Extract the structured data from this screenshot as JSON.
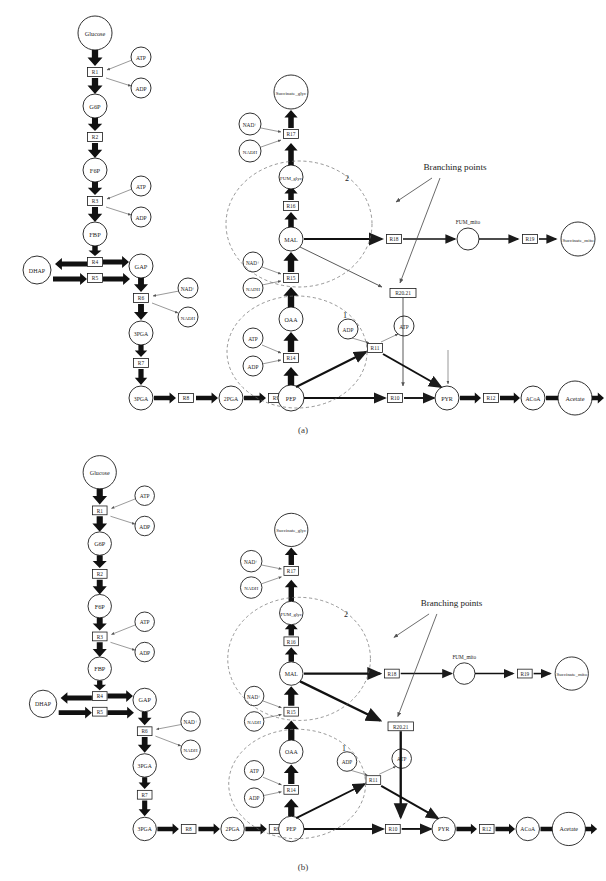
{
  "figure": {
    "panels": [
      {
        "id": "a",
        "caption": "(a)"
      },
      {
        "id": "b",
        "caption": "(b)"
      }
    ],
    "annotation_label": "Branching points",
    "ellipse_labels": {
      "one": "1",
      "two": "2"
    },
    "colors": {
      "node_stroke": "#1a1a1a",
      "arrow_fill": "#111111",
      "dashed_ellipse": "#6b6b6b",
      "thin_line": "#444444",
      "text": "#222222",
      "background": "#ffffff"
    }
  },
  "metabolites": {
    "glucose": "Glucose",
    "g6p": "G6P",
    "f6p": "F6P",
    "fbp": "FBP",
    "dhap": "DHAP",
    "gap": "GAP",
    "pga3": "3PGA",
    "pga2": "2PGA",
    "pep": "PEP",
    "pyr": "PYR",
    "acoa": "ACoA",
    "acetate": "Acetate",
    "oaa": "OAA",
    "mal": "MAL",
    "fum_glyc": "FUM_glyc",
    "succinate_glyc": "Succinate_glyc",
    "fum_mito": "FUM_mito",
    "succinate_mito": "Succinate_mito"
  },
  "cofactors": {
    "atp": "ATP",
    "adp": "ADP",
    "nad": "NAD⁺",
    "nadh": "NADH"
  },
  "reactions": {
    "r1": "R1",
    "r2": "R2",
    "r3": "R3",
    "r4": "R4",
    "r5": "R5",
    "r6": "R6",
    "r7": "R7",
    "r8": "R8",
    "r9": "R9",
    "r10": "R10",
    "r11": "R11",
    "r12": "R12",
    "r13": "R13",
    "r14": "R14",
    "r15": "R15",
    "r16": "R16",
    "r17": "R17",
    "r18": "R18",
    "r19": "R19",
    "r2021": "R20.21"
  },
  "chart_data": {
    "type": "diagram",
    "panels": [
      {
        "id": "a",
        "caption": "(a)",
        "nodes": [
          {
            "id": "Glucose",
            "label": "Glucose",
            "type": "metabolite"
          },
          {
            "id": "G6P",
            "label": "G6P",
            "type": "metabolite"
          },
          {
            "id": "F6P",
            "label": "F6P",
            "type": "metabolite"
          },
          {
            "id": "FBP",
            "label": "FBP",
            "type": "metabolite"
          },
          {
            "id": "DHAP",
            "label": "DHAP",
            "type": "metabolite"
          },
          {
            "id": "GAP",
            "label": "GAP",
            "type": "metabolite"
          },
          {
            "id": "3PGA",
            "label": "3PGA",
            "type": "metabolite"
          },
          {
            "id": "2PGA",
            "label": "2PGA",
            "type": "metabolite"
          },
          {
            "id": "PEP",
            "label": "PEP",
            "type": "metabolite"
          },
          {
            "id": "PYR",
            "label": "PYR",
            "type": "metabolite"
          },
          {
            "id": "ACoA",
            "label": "ACoA",
            "type": "metabolite"
          },
          {
            "id": "Acetate",
            "label": "Acetate",
            "type": "metabolite"
          },
          {
            "id": "OAA",
            "label": "OAA",
            "type": "metabolite"
          },
          {
            "id": "MAL",
            "label": "MAL",
            "type": "metabolite"
          },
          {
            "id": "FUM_glyc",
            "label": "FUM_glyc",
            "type": "metabolite"
          },
          {
            "id": "Succinate_glyc",
            "label": "Succinate_glyc",
            "type": "metabolite"
          },
          {
            "id": "FUM_mito",
            "label": "FUM_mito",
            "type": "metabolite"
          },
          {
            "id": "Succinate_mito",
            "label": "Succinate_mito",
            "type": "metabolite"
          },
          {
            "id": "ATP",
            "label": "ATP",
            "type": "cofactor"
          },
          {
            "id": "ADP",
            "label": "ADP",
            "type": "cofactor"
          },
          {
            "id": "NAD",
            "label": "NAD⁺",
            "type": "cofactor"
          },
          {
            "id": "NADH",
            "label": "NADH",
            "type": "cofactor"
          }
        ],
        "edges": [
          {
            "reaction": "R1",
            "from": "Glucose",
            "to": "G6P",
            "weight": "thick"
          },
          {
            "reaction": "R2",
            "from": "G6P",
            "to": "F6P",
            "weight": "thick"
          },
          {
            "reaction": "R3",
            "from": "F6P",
            "to": "FBP",
            "weight": "thick"
          },
          {
            "reaction": "R4",
            "from": "FBP",
            "to": "GAP",
            "weight": "thick"
          },
          {
            "reaction": "R5",
            "from": "DHAP",
            "to": "GAP",
            "weight": "thick"
          },
          {
            "reaction": "R6",
            "from": "GAP",
            "to": "3PGA",
            "weight": "thick"
          },
          {
            "reaction": "R7",
            "from": "3PGA",
            "to": "2PGA",
            "weight": "thick"
          },
          {
            "reaction": "R8",
            "from": "3PGA",
            "to": "2PGA",
            "weight": "thick"
          },
          {
            "reaction": "R9",
            "from": "2PGA",
            "to": "PEP",
            "weight": "thick"
          },
          {
            "reaction": "R10",
            "from": "PEP",
            "to": "PYR",
            "weight": "medium"
          },
          {
            "reaction": "R11",
            "from": "PEP",
            "to": "PYR",
            "weight": "medium"
          },
          {
            "reaction": "R12",
            "from": "PYR",
            "to": "ACoA",
            "weight": "medium"
          },
          {
            "reaction": "R13",
            "from": "ACoA",
            "to": "Acetate",
            "weight": "medium"
          },
          {
            "reaction": "R14",
            "from": "PEP",
            "to": "OAA",
            "weight": "thick"
          },
          {
            "reaction": "R15",
            "from": "OAA",
            "to": "MAL",
            "weight": "thick"
          },
          {
            "reaction": "R16",
            "from": "MAL",
            "to": "FUM_glyc",
            "weight": "thick"
          },
          {
            "reaction": "R17",
            "from": "FUM_glyc",
            "to": "Succinate_glyc",
            "weight": "thick"
          },
          {
            "reaction": "R18",
            "from": "MAL",
            "to": "FUM_mito",
            "weight": "medium"
          },
          {
            "reaction": "R19",
            "from": "FUM_mito",
            "to": "Succinate_mito",
            "weight": "medium"
          },
          {
            "reaction": "R20.21",
            "from": "MAL",
            "to": "PYR",
            "weight": "thin"
          }
        ],
        "ellipses": [
          {
            "label": "1",
            "encloses": [
              "PEP",
              "OAA",
              "R14",
              "R11",
              "ATP",
              "ADP"
            ]
          },
          {
            "label": "2",
            "encloses": [
              "MAL",
              "FUM_glyc",
              "R15",
              "R16",
              "NAD⁺",
              "NADH"
            ]
          }
        ],
        "annotations": [
          {
            "text": "Branching points",
            "points_to": [
              "R18",
              "R20.21"
            ]
          }
        ]
      },
      {
        "id": "b",
        "caption": "(b)",
        "nodes": [
          {
            "id": "Glucose",
            "label": "Glucose",
            "type": "metabolite"
          },
          {
            "id": "G6P",
            "label": "G6P",
            "type": "metabolite"
          },
          {
            "id": "F6P",
            "label": "F6P",
            "type": "metabolite"
          },
          {
            "id": "FBP",
            "label": "FBP",
            "type": "metabolite"
          },
          {
            "id": "DHAP",
            "label": "DHAP",
            "type": "metabolite"
          },
          {
            "id": "GAP",
            "label": "GAP",
            "type": "metabolite"
          },
          {
            "id": "3PGA",
            "label": "3PGA",
            "type": "metabolite"
          },
          {
            "id": "2PGA",
            "label": "2PGA",
            "type": "metabolite"
          },
          {
            "id": "PEP",
            "label": "PEP",
            "type": "metabolite"
          },
          {
            "id": "PYR",
            "label": "PYR",
            "type": "metabolite"
          },
          {
            "id": "ACoA",
            "label": "ACoA",
            "type": "metabolite"
          },
          {
            "id": "Acetate",
            "label": "Acetate",
            "type": "metabolite"
          },
          {
            "id": "OAA",
            "label": "OAA",
            "type": "metabolite"
          },
          {
            "id": "MAL",
            "label": "MAL",
            "type": "metabolite"
          },
          {
            "id": "FUM_glyc",
            "label": "FUM_glyc",
            "type": "metabolite"
          },
          {
            "id": "Succinate_glyc",
            "label": "Succinate_glyc",
            "type": "metabolite"
          },
          {
            "id": "FUM_mito",
            "label": "FUM_mito",
            "type": "metabolite"
          },
          {
            "id": "Succinate_mito",
            "label": "Succinate_mito",
            "type": "metabolite"
          },
          {
            "id": "ATP",
            "label": "ATP",
            "type": "cofactor"
          },
          {
            "id": "ADP",
            "label": "ADP",
            "type": "cofactor"
          },
          {
            "id": "NAD",
            "label": "NAD⁺",
            "type": "cofactor"
          },
          {
            "id": "NADH",
            "label": "NADH",
            "type": "cofactor"
          }
        ],
        "edges": [
          {
            "reaction": "R1",
            "from": "Glucose",
            "to": "G6P",
            "weight": "thick"
          },
          {
            "reaction": "R2",
            "from": "G6P",
            "to": "F6P",
            "weight": "thick"
          },
          {
            "reaction": "R3",
            "from": "F6P",
            "to": "FBP",
            "weight": "thick"
          },
          {
            "reaction": "R4",
            "from": "FBP",
            "to": "GAP",
            "weight": "thick"
          },
          {
            "reaction": "R5",
            "from": "DHAP",
            "to": "GAP",
            "weight": "thick"
          },
          {
            "reaction": "R6",
            "from": "GAP",
            "to": "3PGA",
            "weight": "thick"
          },
          {
            "reaction": "R7",
            "from": "3PGA",
            "to": "2PGA",
            "weight": "thick"
          },
          {
            "reaction": "R8",
            "from": "3PGA",
            "to": "2PGA",
            "weight": "thick"
          },
          {
            "reaction": "R9",
            "from": "2PGA",
            "to": "PEP",
            "weight": "thick"
          },
          {
            "reaction": "R10",
            "from": "PEP",
            "to": "PYR",
            "weight": "medium"
          },
          {
            "reaction": "R11",
            "from": "PEP",
            "to": "PYR",
            "weight": "medium"
          },
          {
            "reaction": "R12",
            "from": "PYR",
            "to": "ACoA",
            "weight": "medium"
          },
          {
            "reaction": "R13",
            "from": "ACoA",
            "to": "Acetate",
            "weight": "medium"
          },
          {
            "reaction": "R14",
            "from": "PEP",
            "to": "OAA",
            "weight": "thick"
          },
          {
            "reaction": "R15",
            "from": "OAA",
            "to": "MAL",
            "weight": "thick"
          },
          {
            "reaction": "R16",
            "from": "MAL",
            "to": "FUM_glyc",
            "weight": "thick"
          },
          {
            "reaction": "R17",
            "from": "FUM_glyc",
            "to": "Succinate_glyc",
            "weight": "thick"
          },
          {
            "reaction": "R18",
            "from": "MAL",
            "to": "FUM_mito",
            "weight": "medium"
          },
          {
            "reaction": "R19",
            "from": "FUM_mito",
            "to": "Succinate_mito",
            "weight": "medium"
          },
          {
            "reaction": "R20.21",
            "from": "MAL",
            "to": "PYR",
            "weight": "thick"
          }
        ],
        "ellipses": [
          {
            "label": "1",
            "encloses": [
              "PEP",
              "OAA",
              "R14",
              "R11",
              "ATP",
              "ADP"
            ]
          },
          {
            "label": "2",
            "encloses": [
              "MAL",
              "FUM_glyc",
              "R15",
              "R16",
              "NAD⁺",
              "NADH"
            ]
          }
        ],
        "annotations": [
          {
            "text": "Branching points",
            "points_to": [
              "R18",
              "R20.21"
            ]
          }
        ]
      }
    ]
  }
}
